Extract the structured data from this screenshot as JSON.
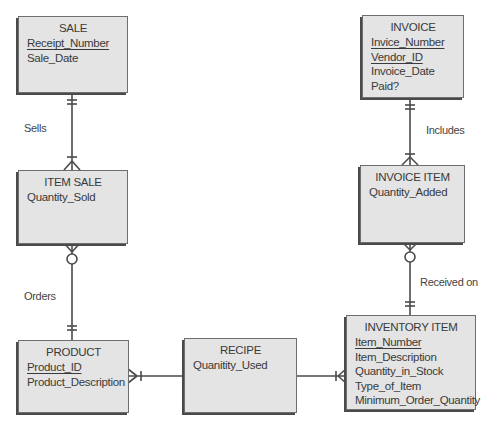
{
  "entities": {
    "sale": {
      "name": "SALE",
      "attributes": [
        {
          "label": "Receipt_Number",
          "pk": true
        },
        {
          "label": "Sale_Date",
          "pk": false
        }
      ]
    },
    "invoice": {
      "name": "INVOICE",
      "attributes": [
        {
          "label": "Invice_Number",
          "pk": true
        },
        {
          "label": "Vendor_ID",
          "pk": true
        },
        {
          "label": "Invoice_Date",
          "pk": false
        },
        {
          "label": "Paid?",
          "pk": false
        }
      ]
    },
    "item_sale": {
      "name": "ITEM SALE",
      "attributes": [
        {
          "label": "Quantity_Sold",
          "pk": false
        }
      ]
    },
    "invoice_item": {
      "name": "INVOICE ITEM",
      "attributes": [
        {
          "label": "Quantity_Added",
          "pk": false
        }
      ]
    },
    "product": {
      "name": "PRODUCT",
      "attributes": [
        {
          "label": "Product_ID",
          "pk": true
        },
        {
          "label": "Product_Description",
          "pk": false
        }
      ]
    },
    "recipe": {
      "name": "RECIPE",
      "attributes": [
        {
          "label": "Quanitity_Used",
          "pk": false
        }
      ]
    },
    "inventory_item": {
      "name": "INVENTORY ITEM",
      "attributes": [
        {
          "label": "Item_Number",
          "pk": true
        },
        {
          "label": "Item_Description",
          "pk": false
        },
        {
          "label": "Quantity_in_Stock",
          "pk": false
        },
        {
          "label": "Type_of_Item",
          "pk": false
        },
        {
          "label": "Minimum_Order_Quantity",
          "pk": false
        }
      ]
    }
  },
  "relationships": [
    {
      "label": "Sells",
      "from": "SALE",
      "to": "ITEM SALE",
      "from_card": "one-and-only-one",
      "to_card": "one-or-many"
    },
    {
      "label": "Orders",
      "from": "PRODUCT",
      "to": "ITEM SALE",
      "from_card": "one-and-only-one",
      "to_card": "zero-or-many"
    },
    {
      "label": "Includes",
      "from": "INVOICE",
      "to": "INVOICE ITEM",
      "from_card": "one-and-only-one",
      "to_card": "one-or-many"
    },
    {
      "label": "Received on",
      "from": "INVENTORY ITEM",
      "to": "INVOICE ITEM",
      "from_card": "one-and-only-one",
      "to_card": "zero-or-many"
    },
    {
      "label": "",
      "from": "RECIPE",
      "to": "PRODUCT",
      "from_card": "",
      "to_card": "one-or-many"
    },
    {
      "label": "",
      "from": "RECIPE",
      "to": "INVENTORY ITEM",
      "from_card": "",
      "to_card": "one-or-many"
    }
  ],
  "labels": {
    "sells": "Sells",
    "orders": "Orders",
    "includes": "Includes",
    "received_on": "Received on"
  },
  "colors": {
    "entity_fill": "#e4e4e4",
    "entity_border": "#6e6e6e",
    "line": "#4a4a4a"
  }
}
